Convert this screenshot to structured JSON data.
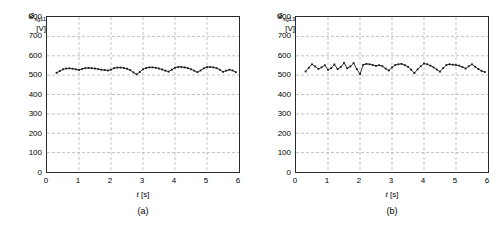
{
  "figure": {
    "background": "#ffffff",
    "line_color": "#1a1a1a",
    "grid_color": "#9a9a9a",
    "axis_color": "#2b2b2b"
  },
  "panels": [
    {
      "caption": "(a)",
      "ylabel_symbol": "G",
      "ylabel_subscript": "sg11",
      "ylabel_unit": "[V]",
      "xlabel_symbol": "t",
      "xlabel_unit": "[s]",
      "ytick_labels": [
        "800",
        "700",
        "600",
        "500",
        "400",
        "300",
        "200",
        "100",
        "0"
      ],
      "xtick_labels": [
        "0",
        "1",
        "2",
        "3",
        "4",
        "5",
        "6"
      ],
      "chart_data": {
        "type": "line",
        "title": "",
        "xlabel": "t [s]",
        "ylabel": "G_sg11 [V]",
        "xlim": [
          0,
          6
        ],
        "ylim": [
          0,
          800
        ],
        "xticks": [
          0,
          1,
          2,
          3,
          4,
          5,
          6
        ],
        "yticks": [
          0,
          100,
          200,
          300,
          400,
          500,
          600,
          700,
          800
        ],
        "grid": true,
        "grid_style": "dashed",
        "legend": "none",
        "marker": "square",
        "series": [
          {
            "name": "G_sg11",
            "x": [
              0.3,
              0.4,
              0.5,
              0.6,
              0.7,
              0.8,
              0.9,
              1.0,
              1.1,
              1.2,
              1.3,
              1.4,
              1.5,
              1.6,
              1.7,
              1.8,
              1.9,
              2.0,
              2.1,
              2.2,
              2.3,
              2.4,
              2.5,
              2.6,
              2.7,
              2.8,
              2.9,
              3.0,
              3.1,
              3.2,
              3.3,
              3.4,
              3.5,
              3.6,
              3.7,
              3.8,
              3.9,
              4.0,
              4.1,
              4.2,
              4.3,
              4.4,
              4.5,
              4.6,
              4.7,
              4.8,
              4.9,
              5.0,
              5.1,
              5.2,
              5.3,
              5.4,
              5.5,
              5.6,
              5.7,
              5.8,
              5.9
            ],
            "y": [
              512,
              521,
              530,
              534,
              535,
              533,
              530,
              526,
              532,
              536,
              537,
              536,
              534,
              531,
              528,
              526,
              524,
              528,
              536,
              539,
              539,
              537,
              533,
              526,
              514,
              504,
              516,
              530,
              537,
              540,
              540,
              538,
              534,
              529,
              523,
              518,
              528,
              538,
              542,
              542,
              540,
              536,
              530,
              523,
              515,
              524,
              535,
              541,
              542,
              540,
              536,
              528,
              517,
              523,
              528,
              524,
              515
            ]
          }
        ]
      }
    },
    {
      "caption": "(b)",
      "ylabel_symbol": "G",
      "ylabel_subscript": "sg13",
      "ylabel_unit": "[V]",
      "xlabel_symbol": "t",
      "xlabel_unit": "[s]",
      "ytick_labels": [
        "800",
        "700",
        "600",
        "500",
        "400",
        "300",
        "200",
        "100",
        "0"
      ],
      "xtick_labels": [
        "0",
        "1",
        "2",
        "3",
        "4",
        "5",
        "6"
      ],
      "chart_data": {
        "type": "line",
        "title": "",
        "xlabel": "t [s]",
        "ylabel": "G_sg13 [V]",
        "xlim": [
          0,
          6
        ],
        "ylim": [
          0,
          800
        ],
        "xticks": [
          0,
          1,
          2,
          3,
          4,
          5,
          6
        ],
        "yticks": [
          0,
          100,
          200,
          300,
          400,
          500,
          600,
          700,
          800
        ],
        "grid": true,
        "grid_style": "dashed",
        "legend": "none",
        "marker": "square",
        "series": [
          {
            "name": "G_sg13",
            "x": [
              0.3,
              0.4,
              0.5,
              0.6,
              0.7,
              0.8,
              0.9,
              1.0,
              1.1,
              1.2,
              1.3,
              1.4,
              1.5,
              1.6,
              1.7,
              1.8,
              1.9,
              2.0,
              2.1,
              2.2,
              2.3,
              2.4,
              2.5,
              2.6,
              2.7,
              2.8,
              2.9,
              3.0,
              3.1,
              3.2,
              3.3,
              3.4,
              3.5,
              3.6,
              3.7,
              3.8,
              3.9,
              4.0,
              4.1,
              4.2,
              4.3,
              4.4,
              4.5,
              4.6,
              4.7,
              4.8,
              4.9,
              5.0,
              5.1,
              5.2,
              5.3,
              5.4,
              5.5,
              5.6,
              5.7,
              5.8,
              5.9
            ],
            "y": [
              519,
              538,
              556,
              545,
              532,
              540,
              551,
              527,
              536,
              555,
              531,
              542,
              563,
              535,
              545,
              562,
              531,
              505,
              553,
              558,
              556,
              552,
              548,
              551,
              546,
              534,
              524,
              540,
              552,
              556,
              558,
              551,
              543,
              528,
              510,
              530,
              546,
              560,
              556,
              549,
              540,
              529,
              518,
              536,
              552,
              556,
              554,
              552,
              549,
              542,
              534,
              546,
              556,
              543,
              531,
              522,
              516
            ]
          }
        ]
      }
    }
  ]
}
